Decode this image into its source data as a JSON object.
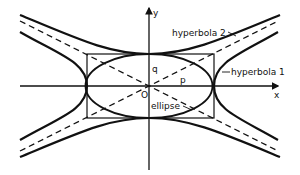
{
  "diagram": {
    "axes": {
      "x_label": "x",
      "y_label": "y",
      "origin_label": "O"
    },
    "labels": {
      "hyperbola1": "hyperbola 1",
      "hyperbola2": "hyperbola 2",
      "ellipse": "ellipse",
      "p": "p",
      "q": "q"
    },
    "colors": {
      "line": "#111111",
      "background": "#ffffff"
    }
  }
}
